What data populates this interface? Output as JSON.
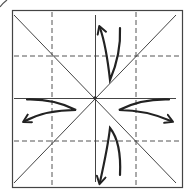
{
  "diagram": {
    "title": "Origami fold diagram: square with diagonals, center creases and quarter guide lines; four flaps fold outward",
    "colors": {
      "background": "#ffffff",
      "outline": "#333333",
      "crease": "#444444",
      "dashed": "#555555",
      "arrow": "#222222"
    },
    "square": {
      "x": 12,
      "y": 10,
      "width": 171,
      "height": 178
    },
    "center": {
      "x": 95,
      "y": 98
    },
    "valley_folds_dashed": {
      "vertical_x": [
        52,
        136
      ],
      "horizontal_y": [
        56,
        141
      ]
    },
    "creases_solid": [
      "diagonal-tl-br",
      "diagonal-tr-bl",
      "center-horizontal",
      "center-vertical"
    ],
    "arrows": [
      {
        "id": "up",
        "direction": "up"
      },
      {
        "id": "down",
        "direction": "down"
      },
      {
        "id": "left",
        "direction": "left"
      },
      {
        "id": "right",
        "direction": "right"
      }
    ]
  }
}
